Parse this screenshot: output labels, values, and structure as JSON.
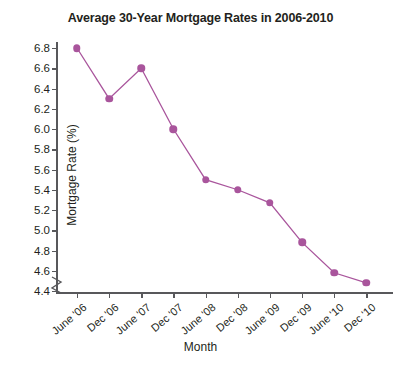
{
  "chart_data": {
    "type": "line",
    "title": "Average 30-Year Mortgage Rates in 2006-2010",
    "xlabel": "Month",
    "ylabel": "Mortgage Rate (%)",
    "categories": [
      "June '06",
      "Dec '06",
      "June '07",
      "Dec '07",
      "June '08",
      "Dec '08",
      "June '09",
      "Dec '09",
      "June '10",
      "Dec '10"
    ],
    "values": [
      6.8,
      6.3,
      6.6,
      6.0,
      5.5,
      5.4,
      5.27,
      4.88,
      4.58,
      4.48
    ],
    "series": [
      {
        "name": "Average 30-Year Mortgage Rate",
        "values": [
          6.8,
          6.3,
          6.6,
          6.0,
          5.5,
          5.4,
          5.27,
          4.88,
          4.58,
          4.48
        ]
      }
    ],
    "ylim": [
      4.4,
      6.8
    ],
    "ytick_labels": [
      "6.8",
      "6.6",
      "6.4",
      "6.2",
      "6.0",
      "5.8",
      "5.6",
      "5.4",
      "5.2",
      "5.0",
      "4.8",
      "4.6",
      "4.4"
    ],
    "ytick_values": [
      6.8,
      6.6,
      6.4,
      6.2,
      6.0,
      5.8,
      5.6,
      5.4,
      5.2,
      5.0,
      4.8,
      4.6,
      4.4
    ],
    "grid": false,
    "legend": "none",
    "y_axis_break": true,
    "line_color": "#a9559c",
    "marker_color": "#a9559c",
    "axis_color": "#58585b",
    "text_color": "#231f20",
    "background_color": "#ffffff"
  }
}
